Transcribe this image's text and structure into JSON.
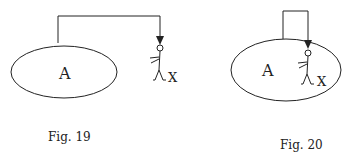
{
  "figures": [
    {
      "id": "fig19",
      "caption": "Fig. 19",
      "region_label": "A",
      "person_label": "X",
      "description": "Arrow leaves region A and points down to person X standing outside A"
    },
    {
      "id": "fig20",
      "caption": "Fig. 20",
      "region_label": "A",
      "person_label": "X",
      "description": "Arrow leaves region A and loops back to person X standing inside A"
    }
  ],
  "colors": {
    "stroke": "#222222",
    "background": "#ffffff"
  }
}
